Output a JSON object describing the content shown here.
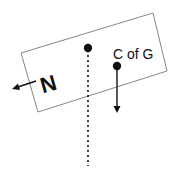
{
  "diagram": {
    "labels": {
      "normal_force": "N",
      "center_of_gravity": "C of G"
    },
    "colors": {
      "stroke": "#111111",
      "box": "#777777",
      "background": "#ffffff"
    }
  }
}
